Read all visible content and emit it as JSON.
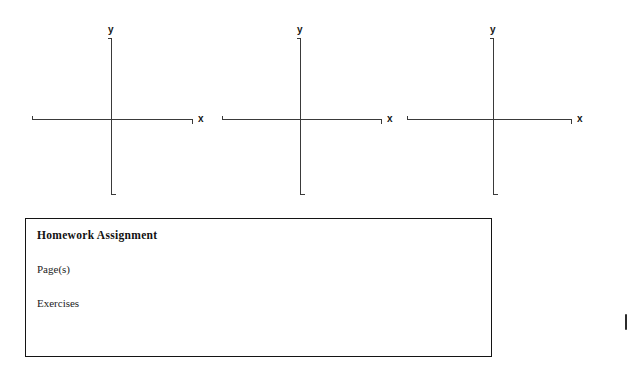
{
  "document": {
    "type": "worksheet",
    "background_color": "#ffffff",
    "ink_color": "#3a3a3a"
  },
  "axes_section": {
    "groups": [
      {
        "id": "axis-group-1",
        "y_label": "y",
        "x_label": "x"
      },
      {
        "id": "axis-group-2",
        "y_label": "y",
        "x_label": "x"
      },
      {
        "id": "axis-group-3",
        "y_label": "y",
        "x_label": "x"
      }
    ]
  },
  "homework_box": {
    "title": "Homework Assignment",
    "lines": [
      "Page(s)",
      "Exercises"
    ],
    "border_color": "#141414"
  }
}
